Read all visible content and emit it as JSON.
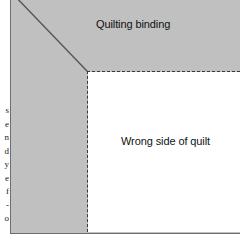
{
  "figure": {
    "colors": {
      "binding_gray": "#c0c0c0",
      "quilt_white": "#ffffff",
      "stitch_line": "#3a3a3a",
      "seam_line": "#555555",
      "frame_border": "#6e6e6e",
      "text": "#111111"
    },
    "labels": {
      "binding": "Quilting binding",
      "quilt": "Wrong side of quilt"
    },
    "regions": {
      "binding_name": "quilting-binding-region",
      "quilt_name": "wrong-side-of-quilt-region"
    },
    "stitching": {
      "horizontal_label": "horizontal stitching line",
      "vertical_label": "vertical stitching line",
      "style": "dashed"
    },
    "miter": {
      "label": "mitered corner seam",
      "from_x": 0,
      "from_y": 0,
      "to_x": 77,
      "to_y": 80
    }
  },
  "margin_text": {
    "lines": [
      "s",
      "e",
      "n",
      "d",
      "y",
      "e",
      "f",
      "-",
      "o"
    ]
  }
}
